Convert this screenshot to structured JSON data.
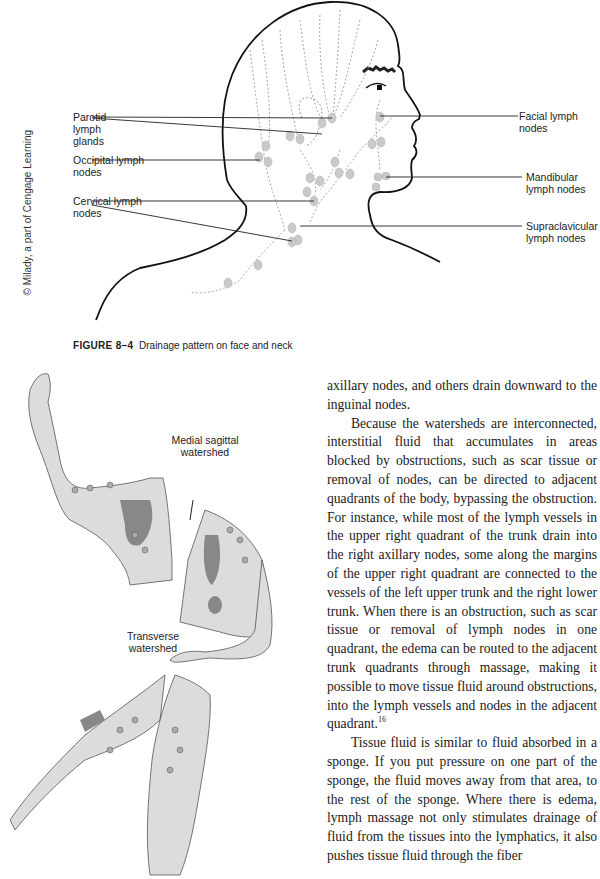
{
  "figure_top": {
    "caption_number": "FIGURE 8–4",
    "caption_text": "Drainage pattern on face and neck",
    "credit": "© Milady, a part of Cengage Learning",
    "labels_left": [
      {
        "id": "parotid",
        "text": "Parotid lymph glands"
      },
      {
        "id": "occipital",
        "text": "Occipital lymph nodes"
      },
      {
        "id": "cervical",
        "text": "Cervical lymph nodes"
      }
    ],
    "labels_right": [
      {
        "id": "facial",
        "text": "Facial lymph nodes"
      },
      {
        "id": "mandibular",
        "text": "Mandibular lymph nodes"
      },
      {
        "id": "supraclavicular",
        "text": "Supraclavicular lymph nodes"
      }
    ]
  },
  "figure_bottom": {
    "labels": [
      {
        "id": "medial",
        "line1": "Medial sagittal",
        "line2": "watershed"
      },
      {
        "id": "transverse",
        "line1": "Transverse",
        "line2": "watershed"
      }
    ]
  },
  "body_text": {
    "p1": "axillary nodes, and others drain downward to the inguinal nodes.",
    "p2": "Because the watersheds are interconnected, interstitial fluid that accumulates in areas blocked by obstructions, such as scar tissue or removal of nodes, can be directed to adjacent quadrants of the body, bypassing the obstruction. For instance, while most of the lymph vessels in the upper right quadrant of the trunk drain into the right axillary nodes, some along the margins of the upper right quadrant are connected to the vessels of the left upper trunk and the right lower trunk. When there is an obstruction, such as scar tissue or removal of lymph nodes in one quadrant, the edema can be routed to the adjacent trunk quadrants through massage, making it possible to move tissue fluid around obstructions, into the lymph vessels and nodes in the adjacent quadrant.",
    "p2_footnote": "16",
    "p3": "Tissue fluid is similar to fluid absorbed in a sponge. If you put pressure on one part of the sponge, the fluid moves away from that area, to the rest of the sponge. Where there is edema, lymph massage not only stimulates drainage of fluid from the tissues into the lymphatics, it also pushes tissue fluid through the fiber"
  }
}
